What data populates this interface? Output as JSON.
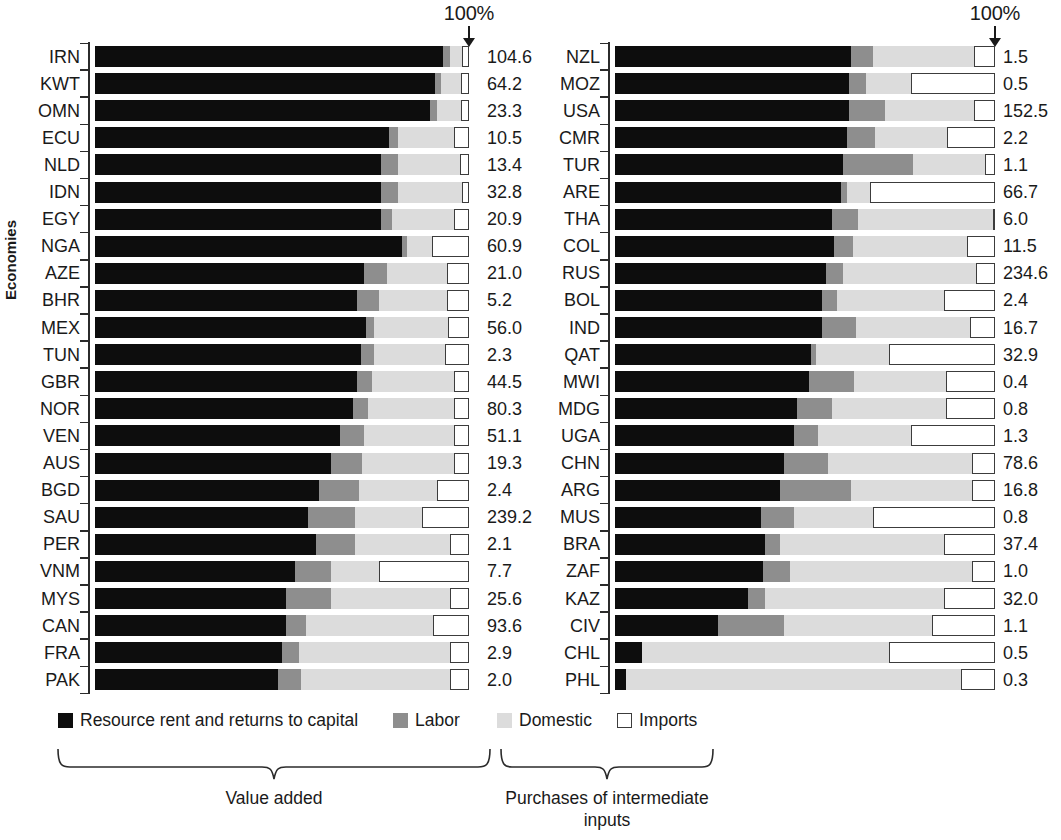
{
  "axis": {
    "ylabel": "Economies",
    "hundred_label": "100%"
  },
  "legend": {
    "items": [
      {
        "key": "capital",
        "label": "Resource rent and returns to capital"
      },
      {
        "key": "labor",
        "label": "Labor"
      },
      {
        "key": "domestic",
        "label": "Domestic"
      },
      {
        "key": "imports",
        "label": "Imports"
      }
    ]
  },
  "braces": {
    "left_caption": "Value added",
    "right_caption": "Purchases of intermediate inputs"
  },
  "colors": {
    "capital": "#0d0d0d",
    "labor": "#8e8e8e",
    "domestic": "#dcdcdc",
    "imports": "#ffffff",
    "imports_border": "#3c3c3c",
    "axis": "#2b2b2b",
    "text": "#1a1a1a"
  },
  "chart_data": {
    "type": "bar",
    "title": "",
    "subtitle": "",
    "orientation": "horizontal",
    "stacked": true,
    "normalized_to": 100,
    "xlabel": "",
    "ylabel": "Economies",
    "xlim": [
      0,
      100
    ],
    "grid": false,
    "legend_position": "bottom",
    "annotations": [
      "100%"
    ],
    "series": [
      {
        "name": "Resource rent and returns to capital",
        "key": "capital"
      },
      {
        "name": "Labor",
        "key": "labor"
      },
      {
        "name": "Domestic",
        "key": "domestic"
      },
      {
        "name": "Imports",
        "key": "imports"
      }
    ],
    "value_column_note": "Number at the right of each bar is the economy's total (units as published)",
    "panels": [
      {
        "id": "left",
        "rows": [
          {
            "code": "IRN",
            "capital": 93.0,
            "labor": 2.0,
            "domestic": 3.2,
            "imports": 1.8,
            "value": "104.6"
          },
          {
            "code": "KWT",
            "capital": 91.0,
            "labor": 1.6,
            "domestic": 5.4,
            "imports": 2.0,
            "value": "64.2"
          },
          {
            "code": "OMN",
            "capital": 89.5,
            "labor": 2.0,
            "domestic": 6.3,
            "imports": 2.2,
            "value": "23.3"
          },
          {
            "code": "ECU",
            "capital": 78.5,
            "labor": 2.5,
            "domestic": 15.0,
            "imports": 4.0,
            "value": "10.5"
          },
          {
            "code": "NLD",
            "capital": 76.5,
            "labor": 4.5,
            "domestic": 16.5,
            "imports": 2.5,
            "value": "13.4"
          },
          {
            "code": "IDN",
            "capital": 76.5,
            "labor": 4.5,
            "domestic": 17.0,
            "imports": 2.0,
            "value": "32.8"
          },
          {
            "code": "EGY",
            "capital": 76.5,
            "labor": 3.0,
            "domestic": 16.5,
            "imports": 4.0,
            "value": "20.9"
          },
          {
            "code": "NGA",
            "capital": 82.0,
            "labor": 1.5,
            "domestic": 6.5,
            "imports": 10.0,
            "value": "60.9"
          },
          {
            "code": "AZE",
            "capital": 72.0,
            "labor": 6.0,
            "domestic": 16.0,
            "imports": 6.0,
            "value": "21.0"
          },
          {
            "code": "BHR",
            "capital": 70.0,
            "labor": 6.0,
            "domestic": 18.0,
            "imports": 6.0,
            "value": "5.2"
          },
          {
            "code": "MEX",
            "capital": 72.5,
            "labor": 2.0,
            "domestic": 20.0,
            "imports": 5.5,
            "value": "56.0"
          },
          {
            "code": "TUN",
            "capital": 71.0,
            "labor": 3.5,
            "domestic": 19.0,
            "imports": 6.5,
            "value": "2.3"
          },
          {
            "code": "GBR",
            "capital": 70.0,
            "labor": 4.0,
            "domestic": 22.0,
            "imports": 4.0,
            "value": "44.5"
          },
          {
            "code": "NOR",
            "capital": 69.0,
            "labor": 4.0,
            "domestic": 23.0,
            "imports": 4.0,
            "value": "80.3"
          },
          {
            "code": "VEN",
            "capital": 65.5,
            "labor": 6.5,
            "domestic": 24.0,
            "imports": 4.0,
            "value": "51.1"
          },
          {
            "code": "AUS",
            "capital": 63.0,
            "labor": 8.5,
            "domestic": 24.5,
            "imports": 4.0,
            "value": "19.3"
          },
          {
            "code": "BGD",
            "capital": 60.0,
            "labor": 10.5,
            "domestic": 21.0,
            "imports": 8.5,
            "value": "2.4"
          },
          {
            "code": "SAU",
            "capital": 57.0,
            "labor": 12.5,
            "domestic": 18.0,
            "imports": 12.5,
            "value": "239.2"
          },
          {
            "code": "PER",
            "capital": 59.0,
            "labor": 10.5,
            "domestic": 25.5,
            "imports": 5.0,
            "value": "2.1"
          },
          {
            "code": "VNM",
            "capital": 53.5,
            "labor": 9.5,
            "domestic": 13.0,
            "imports": 24.0,
            "value": "7.7"
          },
          {
            "code": "MYS",
            "capital": 51.0,
            "labor": 12.0,
            "domestic": 32.0,
            "imports": 5.0,
            "value": "25.6"
          },
          {
            "code": "CAN",
            "capital": 51.0,
            "labor": 5.5,
            "domestic": 34.0,
            "imports": 9.5,
            "value": "93.6"
          },
          {
            "code": "FRA",
            "capital": 50.0,
            "labor": 4.5,
            "domestic": 40.5,
            "imports": 5.0,
            "value": "2.9"
          },
          {
            "code": "PAK",
            "capital": 49.0,
            "labor": 6.0,
            "domestic": 40.0,
            "imports": 5.0,
            "value": "2.0"
          }
        ]
      },
      {
        "id": "right",
        "rows": [
          {
            "code": "NZL",
            "capital": 62.0,
            "labor": 6.0,
            "domestic": 26.5,
            "imports": 5.5,
            "value": "1.5"
          },
          {
            "code": "MOZ",
            "capital": 61.5,
            "labor": 4.5,
            "domestic": 12.0,
            "imports": 22.0,
            "value": "0.5"
          },
          {
            "code": "USA",
            "capital": 61.5,
            "labor": 9.5,
            "domestic": 23.5,
            "imports": 5.5,
            "value": "152.5"
          },
          {
            "code": "CMR",
            "capital": 61.0,
            "labor": 7.5,
            "domestic": 19.0,
            "imports": 12.5,
            "value": "2.2"
          },
          {
            "code": "TUR",
            "capital": 60.0,
            "labor": 18.5,
            "domestic": 19.0,
            "imports": 2.5,
            "value": "1.1"
          },
          {
            "code": "ARE",
            "capital": 59.5,
            "labor": 1.5,
            "domestic": 6.0,
            "imports": 33.0,
            "value": "66.7"
          },
          {
            "code": "THA",
            "capital": 57.0,
            "labor": 7.0,
            "domestic": 35.5,
            "imports": 0.5,
            "value": "6.0"
          },
          {
            "code": "COL",
            "capital": 57.5,
            "labor": 5.0,
            "domestic": 30.0,
            "imports": 7.5,
            "value": "11.5"
          },
          {
            "code": "RUS",
            "capital": 55.5,
            "labor": 4.5,
            "domestic": 35.0,
            "imports": 5.0,
            "value": "234.6"
          },
          {
            "code": "BOL",
            "capital": 54.5,
            "labor": 4.0,
            "domestic": 28.0,
            "imports": 13.5,
            "value": "2.4"
          },
          {
            "code": "IND",
            "capital": 54.5,
            "labor": 9.0,
            "domestic": 30.0,
            "imports": 6.5,
            "value": "16.7"
          },
          {
            "code": "QAT",
            "capital": 51.5,
            "labor": 1.5,
            "domestic": 19.0,
            "imports": 28.0,
            "value": "32.9"
          },
          {
            "code": "MWI",
            "capital": 51.0,
            "labor": 12.0,
            "domestic": 24.0,
            "imports": 13.0,
            "value": "0.4"
          },
          {
            "code": "MDG",
            "capital": 48.0,
            "labor": 9.0,
            "domestic": 30.0,
            "imports": 13.0,
            "value": "0.8"
          },
          {
            "code": "UGA",
            "capital": 47.0,
            "labor": 6.5,
            "domestic": 24.5,
            "imports": 22.0,
            "value": "1.3"
          },
          {
            "code": "CHN",
            "capital": 44.5,
            "labor": 11.5,
            "domestic": 38.0,
            "imports": 6.0,
            "value": "78.6"
          },
          {
            "code": "ARG",
            "capital": 43.5,
            "labor": 18.5,
            "domestic": 32.0,
            "imports": 6.0,
            "value": "16.8"
          },
          {
            "code": "MUS",
            "capital": 38.5,
            "labor": 8.5,
            "domestic": 21.0,
            "imports": 32.0,
            "value": "0.8"
          },
          {
            "code": "BRA",
            "capital": 39.5,
            "labor": 4.0,
            "domestic": 43.0,
            "imports": 13.5,
            "value": "37.4"
          },
          {
            "code": "ZAF",
            "capital": 39.0,
            "labor": 7.0,
            "domestic": 48.0,
            "imports": 6.0,
            "value": "1.0"
          },
          {
            "code": "KAZ",
            "capital": 35.0,
            "labor": 4.5,
            "domestic": 47.0,
            "imports": 13.5,
            "value": "32.0"
          },
          {
            "code": "CIV",
            "capital": 27.0,
            "labor": 17.5,
            "domestic": 39.0,
            "imports": 16.5,
            "value": "1.1"
          },
          {
            "code": "CHL",
            "capital": 7.0,
            "labor": 0.0,
            "domestic": 65.0,
            "imports": 28.0,
            "value": "0.5"
          },
          {
            "code": "PHL",
            "capital": 3.0,
            "labor": 0.0,
            "domestic": 88.0,
            "imports": 9.0,
            "value": "0.3"
          }
        ]
      }
    ]
  }
}
